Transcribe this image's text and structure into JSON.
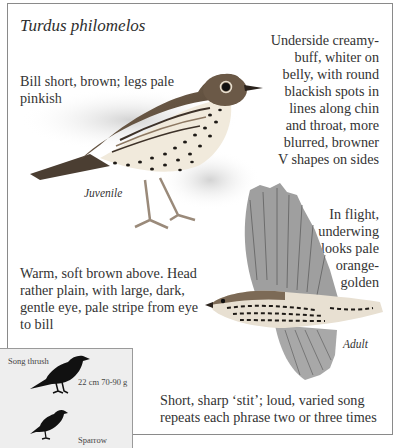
{
  "page": {
    "title": "Turdus philomelos"
  },
  "notes": {
    "bill": "Bill short, brown; legs pale pinkish",
    "underside": [
      "Underside creamy-",
      "buff, whiter on",
      "belly, with round",
      "blackish spots in",
      "lines along chin",
      "and throat, more",
      "blurred, browner",
      "V shapes on sides"
    ],
    "flight": [
      "In flight,",
      "underwing",
      "looks pale",
      "orange-",
      "golden"
    ],
    "upperparts": [
      "Warm, soft brown above. Head",
      "rather plain, with large, dark,",
      "gentle eye, pale stripe from eye",
      "to bill"
    ],
    "voice": [
      "Short, sharp ‘stit’; loud, varied song",
      "repeats each phrase two or three times"
    ]
  },
  "illustrations": {
    "juvenile_label": "Juvenile",
    "adult_label": "Adult"
  },
  "size_comparison": {
    "species_label": "Song thrush",
    "species_measurements": "22 cm  70-90 g",
    "reference_label": "Sparrow"
  },
  "colors": {
    "frame_border": "#8a8a8a",
    "text": "#333333",
    "silhouette_box": "#eeeeee",
    "silhouette": "#111111",
    "plumage_brown": "#6e5a44"
  }
}
